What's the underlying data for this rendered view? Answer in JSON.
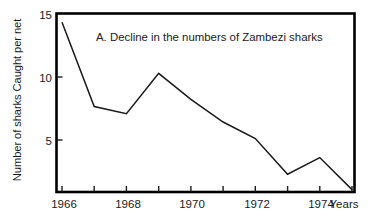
{
  "chart_data": {
    "type": "line",
    "title": "A.   Decline in the numbers of Zambezi sharks",
    "xlabel": "Years",
    "ylabel": "Number of sharks  Caught per net",
    "x": [
      1966,
      1967,
      1968,
      1969,
      1970,
      1971,
      1972,
      1973,
      1974,
      1975
    ],
    "values": [
      14.3,
      7.2,
      6.6,
      10.0,
      7.8,
      5.9,
      4.5,
      1.5,
      2.9,
      0.2
    ],
    "series": [
      {
        "name": "Zambezi sharks caught per net",
        "values": [
          14.3,
          7.2,
          6.6,
          10.0,
          7.8,
          5.9,
          4.5,
          1.5,
          2.9,
          0.2
        ]
      }
    ],
    "xlim": [
      1966,
      1975
    ],
    "ylim": [
      0,
      15
    ],
    "xticks": [
      1966,
      1967,
      1968,
      1969,
      1970,
      1971,
      1972,
      1973,
      1974,
      1975
    ],
    "xtick_labels": [
      "1966",
      "",
      "1968",
      "",
      "1970",
      "",
      "1972",
      "",
      "1974",
      ""
    ],
    "yticks": [
      5,
      10,
      15
    ],
    "ytick_labels": [
      "5",
      "10",
      "15"
    ],
    "grid": false,
    "legend": "none",
    "line_color": "#1a1a1a",
    "frame_color": "#000000",
    "background_color": "#ffffff"
  },
  "axis": {
    "x_tick_labels": [
      {
        "value": "1966",
        "x": 1966
      },
      {
        "value": "1968",
        "x": 1968
      },
      {
        "value": "1970",
        "x": 1970
      },
      {
        "value": "1972",
        "x": 1972
      },
      {
        "value": "1974",
        "x": 1974
      }
    ],
    "y_tick_labels": [
      {
        "value": "15",
        "y": 15
      },
      {
        "value": "10",
        "y": 10
      },
      {
        "value": "5",
        "y": 5
      }
    ],
    "x_axis_caption": "Years"
  }
}
